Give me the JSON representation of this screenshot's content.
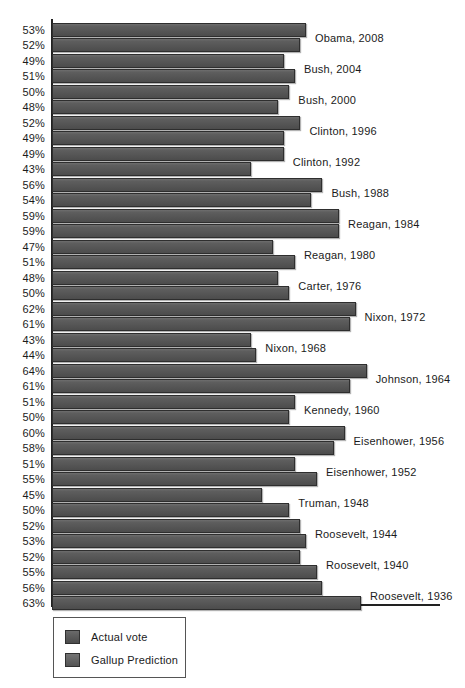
{
  "chart_data": {
    "type": "bar",
    "orientation": "horizontal",
    "title": "",
    "xlabel": "",
    "ylabel": "",
    "xlim": [
      7,
      70
    ],
    "grid": false,
    "legend_position": "bottom-left",
    "value_suffix": "%",
    "categories": [
      "Obama, 2008",
      "Bush, 2004",
      "Bush, 2000",
      "Clinton, 1996",
      "Clinton, 1992",
      "Bush, 1988",
      "Reagan, 1984",
      "Reagan, 1980",
      "Carter, 1976",
      "Nixon, 1972",
      "Nixon, 1968",
      "Johnson, 1964",
      "Kennedy, 1960",
      "Eisenhower, 1956",
      "Eisenhower, 1952",
      "Truman, 1948",
      "Roosevelt, 1944",
      "Roosevelt, 1940",
      "Roosevelt, 1936"
    ],
    "series": [
      {
        "name": "Actual vote",
        "values": [
          53,
          49,
          50,
          52,
          49,
          56,
          59,
          47,
          48,
          62,
          43,
          64,
          51,
          60,
          51,
          45,
          52,
          52,
          56
        ]
      },
      {
        "name": "Gallup Prediction",
        "values": [
          52,
          51,
          48,
          49,
          43,
          54,
          59,
          51,
          50,
          61,
          44,
          61,
          50,
          58,
          55,
          50,
          53,
          55,
          63
        ]
      }
    ]
  },
  "rows": [
    {
      "label": "Obama, 2008",
      "actual": "53%",
      "gallup": "52%"
    },
    {
      "label": "Bush, 2004",
      "actual": "49%",
      "gallup": "51%"
    },
    {
      "label": "Bush, 2000",
      "actual": "50%",
      "gallup": "48%"
    },
    {
      "label": "Clinton, 1996",
      "actual": "52%",
      "gallup": "49%"
    },
    {
      "label": "Clinton, 1992",
      "actual": "49%",
      "gallup": "43%"
    },
    {
      "label": "Bush, 1988",
      "actual": "56%",
      "gallup": "54%"
    },
    {
      "label": "Reagan, 1984",
      "actual": "59%",
      "gallup": "59%"
    },
    {
      "label": "Reagan, 1980",
      "actual": "47%",
      "gallup": "51%"
    },
    {
      "label": "Carter, 1976",
      "actual": "48%",
      "gallup": "50%"
    },
    {
      "label": "Nixon, 1972",
      "actual": "62%",
      "gallup": "61%"
    },
    {
      "label": "Nixon, 1968",
      "actual": "43%",
      "gallup": "44%"
    },
    {
      "label": "Johnson, 1964",
      "actual": "64%",
      "gallup": "61%"
    },
    {
      "label": "Kennedy, 1960",
      "actual": "51%",
      "gallup": "50%"
    },
    {
      "label": "Eisenhower, 1956",
      "actual": "60%",
      "gallup": "58%"
    },
    {
      "label": "Eisenhower, 1952",
      "actual": "51%",
      "gallup": "55%"
    },
    {
      "label": "Truman, 1948",
      "actual": "45%",
      "gallup": "50%"
    },
    {
      "label": "Roosevelt, 1944",
      "actual": "52%",
      "gallup": "53%"
    },
    {
      "label": "Roosevelt, 1940",
      "actual": "52%",
      "gallup": "55%"
    },
    {
      "label": "Roosevelt, 1936",
      "actual": "56%",
      "gallup": "63%"
    }
  ],
  "legend": {
    "items": [
      {
        "label": "Actual vote",
        "color": "#575757"
      },
      {
        "label": "Gallup Prediction",
        "color": "#616161"
      }
    ]
  },
  "colors": {
    "bar_actual": "#575757",
    "bar_gallup": "#616161",
    "axis": "#222222",
    "text": "#1b1b1b",
    "background": "#ffffff"
  }
}
